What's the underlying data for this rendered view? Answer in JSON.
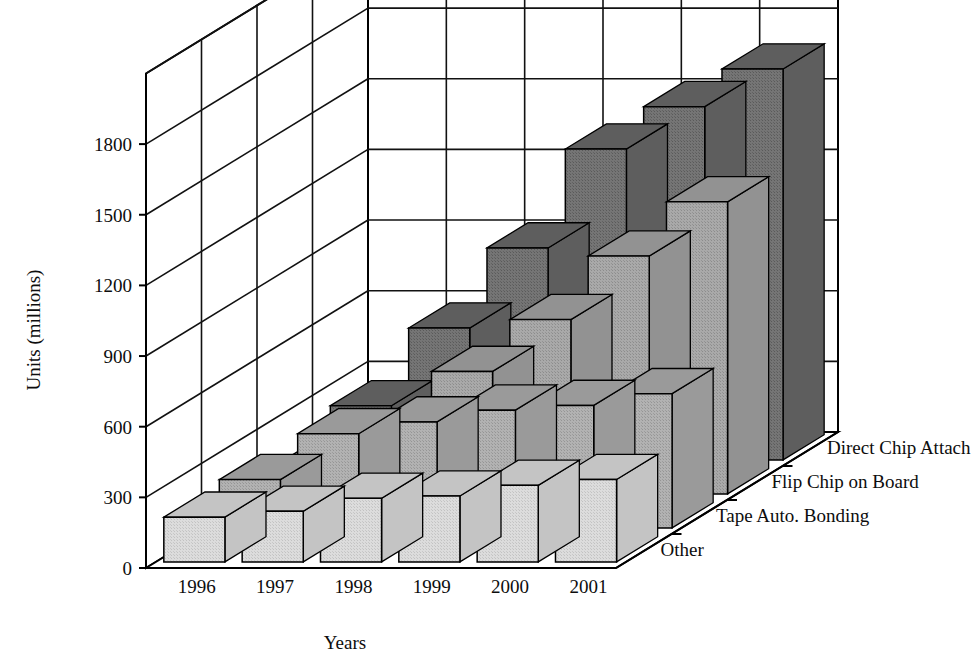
{
  "chart_data": {
    "type": "bar",
    "subtype": "3d-grouped-bar",
    "title": "",
    "xlabel": "Years",
    "ylabel": "Units (millions)",
    "zlabel": "",
    "categories": [
      "1996",
      "1997",
      "1998",
      "1999",
      "2000",
      "2001"
    ],
    "ylim": [
      0,
      2100
    ],
    "yticks": [
      0,
      300,
      600,
      900,
      1200,
      1500,
      1800
    ],
    "ytick_labels": [
      "0",
      "300",
      "600",
      "900",
      "1200",
      "1500",
      "1800"
    ],
    "grid": true,
    "legend_position": "right-depth-axis",
    "series": [
      {
        "name": "Other",
        "depth_index": 0,
        "color": "#d4d4d4",
        "values": [
          190,
          215,
          270,
          280,
          325,
          350
        ]
      },
      {
        "name": "Tape Auto. Bonding",
        "depth_index": 1,
        "color": "#a8a8a8",
        "values": [
          205,
          400,
          450,
          500,
          520,
          570
        ]
      },
      {
        "name": "Flip Chip on Board",
        "depth_index": 2,
        "color": "#a0a0a0",
        "values": [
          120,
          250,
          520,
          740,
          1010,
          1240
        ]
      },
      {
        "name": "Direct Chip Attach",
        "depth_index": 3,
        "color": "#6b6b6b",
        "values": [
          230,
          560,
          900,
          1320,
          1500,
          1660
        ]
      }
    ]
  },
  "axis": {
    "y_title": "Units (millions)",
    "x_title": "Years",
    "tick_labels": [
      "1800",
      "1500",
      "1200",
      "900",
      "600",
      "300",
      "0"
    ],
    "category_labels": [
      "1996",
      "1997",
      "1998",
      "1999",
      "2000",
      "2001"
    ]
  },
  "legend": {
    "items": [
      {
        "label": "Direct Chip Attach"
      },
      {
        "label": "Flip Chip on Board"
      },
      {
        "label": "Tape Auto. Bonding"
      },
      {
        "label": "Other"
      }
    ]
  },
  "colors": {
    "series_other": "#d4d4d4",
    "series_tape_auto_bonding": "#a8a8a8",
    "series_flip_chip_on_board": "#a0a0a0",
    "series_direct_chip_attach": "#6b6b6b",
    "axis": "#000000",
    "grid": "#111111",
    "background": "#ffffff"
  }
}
